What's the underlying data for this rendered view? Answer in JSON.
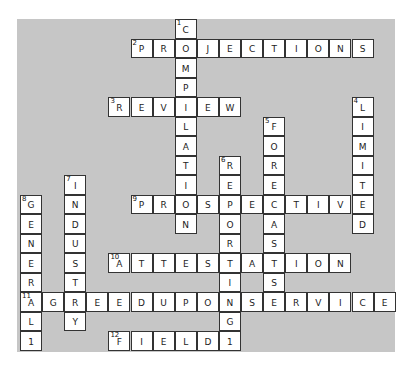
{
  "puzzle": {
    "board_color": "#c6c6c6",
    "grid": {
      "cols": 17,
      "rows": 17,
      "origin_x": 20,
      "origin_y": 19,
      "cell_w": 22.1,
      "cell_h": 19.5
    },
    "words": [
      {
        "number": 1,
        "direction": "down",
        "row": 0,
        "col": 7,
        "answer": "COMPILATION"
      },
      {
        "number": 2,
        "direction": "across",
        "row": 1,
        "col": 5,
        "answer": "PROJECTIONS"
      },
      {
        "number": 3,
        "direction": "across",
        "row": 4,
        "col": 4,
        "answer": "REVIEW"
      },
      {
        "number": 4,
        "direction": "down",
        "row": 4,
        "col": 15,
        "answer": "LIMITED"
      },
      {
        "number": 5,
        "direction": "down",
        "row": 5,
        "col": 11,
        "answer": "FORECASTS"
      },
      {
        "number": 6,
        "direction": "down",
        "row": 7,
        "col": 9,
        "answer": "REPORTING1"
      },
      {
        "number": 7,
        "direction": "down",
        "row": 8,
        "col": 2,
        "answer": "INDUSTRY"
      },
      {
        "number": 8,
        "direction": "down",
        "row": 9,
        "col": 0,
        "answer": "GENERAL1"
      },
      {
        "number": 9,
        "direction": "across",
        "row": 9,
        "col": 5,
        "answer": "PROSPECTIVE"
      },
      {
        "number": 10,
        "direction": "across",
        "row": 12,
        "col": 4,
        "answer": "ATTESTATION"
      },
      {
        "number": 11,
        "direction": "across",
        "row": 14,
        "col": 0,
        "answer": "AGREEDUPONSERVICE"
      },
      {
        "number": 12,
        "direction": "across",
        "row": 16,
        "col": 4,
        "answer": "FIELD1"
      }
    ]
  }
}
